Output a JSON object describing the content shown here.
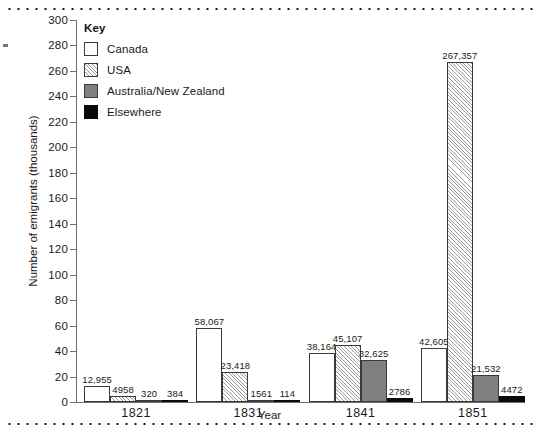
{
  "chart_data": {
    "type": "bar",
    "title": "",
    "xlabel": "Year",
    "ylabel": "Number of emigrants (thousands)",
    "categories": [
      "1821",
      "1831",
      "1841",
      "1851"
    ],
    "ylim": [
      0,
      300
    ],
    "ytick_step": 20,
    "yticks": [
      0,
      20,
      40,
      60,
      80,
      100,
      120,
      140,
      160,
      180,
      200,
      220,
      240,
      260,
      280,
      300
    ],
    "grid": false,
    "legend_position": "top-left",
    "legend_title": "Key",
    "series": [
      {
        "name": "Canada",
        "fill": "white",
        "color": "#ffffff",
        "values": [
          12955,
          58067,
          38164,
          42605
        ],
        "labels": [
          "12,955",
          "58,067",
          "38,164",
          "42,605"
        ]
      },
      {
        "name": "USA",
        "fill": "diagonal-hatch",
        "color": "#f4f4f4",
        "values": [
          4958,
          23418,
          45107,
          267357
        ],
        "labels": [
          "4958",
          "23,418",
          "45,107",
          "267,357"
        ]
      },
      {
        "name": "Australia/New Zealand",
        "fill": "gray",
        "color": "#808080",
        "values": [
          320,
          1561,
          32625,
          21532
        ],
        "labels": [
          "320",
          "1561",
          "32,625",
          "21,532"
        ]
      },
      {
        "name": "Elsewhere",
        "fill": "black",
        "color": "#0a0a0a",
        "values": [
          384,
          114,
          2786,
          4472
        ],
        "labels": [
          "384",
          "114",
          "2786",
          "4472"
        ]
      }
    ]
  }
}
